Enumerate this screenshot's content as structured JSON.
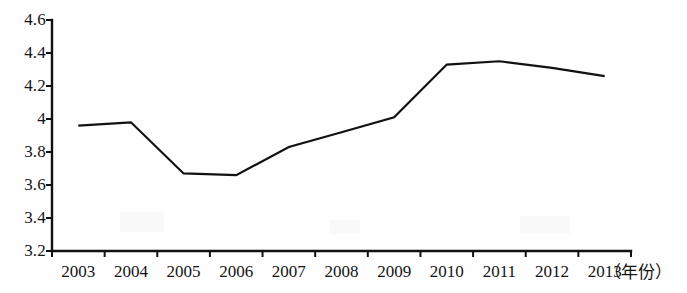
{
  "chart_data": {
    "type": "line",
    "title": "",
    "subtitle": "",
    "xlabel": "（年份）",
    "ylabel": "",
    "categories": [
      "2003",
      "2004",
      "2005",
      "2006",
      "2007",
      "2008",
      "2009",
      "2010",
      "2011",
      "2012",
      "2013"
    ],
    "values": [
      3.96,
      3.98,
      3.67,
      3.66,
      3.83,
      3.92,
      4.01,
      4.33,
      4.35,
      4.31,
      4.26
    ],
    "series": [
      {
        "name": "",
        "values": [
          3.96,
          3.98,
          3.67,
          3.66,
          3.83,
          3.92,
          4.01,
          4.33,
          4.35,
          4.31,
          4.26
        ]
      }
    ],
    "ylim": [
      3.2,
      4.6
    ],
    "yticks": [
      3.2,
      3.4,
      3.6,
      3.8,
      4.0,
      4.2,
      4.4,
      4.6
    ],
    "ytick_labels": [
      "3.2",
      "3.4",
      "3.6",
      "3.8",
      "4",
      "4.2",
      "4.4",
      "4.6"
    ],
    "xtick_labels": [
      "2003",
      "2004",
      "2005",
      "2006",
      "2007",
      "2008",
      "2009",
      "2010",
      "2011",
      "2012",
      "2013"
    ],
    "grid": false,
    "legend": false,
    "legend_position": "none",
    "line_color": "#111111",
    "line_width": 2.2,
    "markers": false,
    "background_color": "#ffffff",
    "axis_color": "#111111"
  },
  "axis": {
    "unit_label": "（年份）",
    "y_top_label": "4.6",
    "y_bottom_label": "3.2"
  }
}
